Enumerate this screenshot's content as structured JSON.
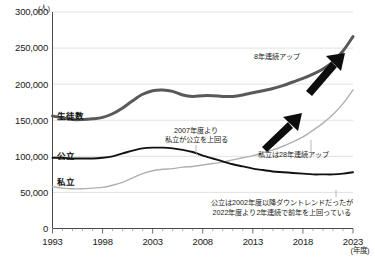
{
  "chart_data": {
    "type": "line",
    "title": "",
    "xlabel": "(年度)",
    "ylabel": "(人)",
    "ylim": [
      0,
      300000
    ],
    "xlim": [
      1993,
      2023
    ],
    "grid": true,
    "legend": "inline-labels",
    "ytick_labels": [
      "0",
      "50,000",
      "100,000",
      "150,000",
      "200,000",
      "250,000",
      "300,000"
    ],
    "ytick_values": [
      0,
      50000,
      100000,
      150000,
      200000,
      250000,
      300000
    ],
    "xtick_labels": [
      "1993",
      "1998",
      "2003",
      "2008",
      "2013",
      "2018",
      "2023"
    ],
    "xtick_values": [
      1993,
      1998,
      2003,
      2008,
      2013,
      2018,
      2023
    ],
    "x": [
      1993,
      1994,
      1995,
      1996,
      1997,
      1998,
      1999,
      2000,
      2001,
      2002,
      2003,
      2004,
      2005,
      2006,
      2007,
      2008,
      2009,
      2010,
      2011,
      2012,
      2013,
      2014,
      2015,
      2016,
      2017,
      2018,
      2019,
      2020,
      2021,
      2022,
      2023
    ],
    "series": [
      {
        "name": "生徒数",
        "color": "#595959",
        "width": 3.0,
        "values": [
          156000,
          153000,
          151000,
          151000,
          152000,
          154000,
          159000,
          167000,
          177000,
          186000,
          191000,
          192000,
          190000,
          185000,
          183000,
          184000,
          184000,
          183000,
          183000,
          185000,
          188000,
          191000,
          194000,
          198000,
          203000,
          208000,
          214000,
          221000,
          231000,
          246000,
          266000
        ]
      },
      {
        "name": "公立",
        "color": "#111111",
        "width": 1.9,
        "values": [
          98000,
          98000,
          97000,
          97000,
          97000,
          98000,
          100000,
          104000,
          108000,
          111000,
          112000,
          112000,
          111000,
          109000,
          106000,
          101000,
          97000,
          93000,
          89000,
          86000,
          83000,
          81000,
          79000,
          78000,
          77000,
          76000,
          75000,
          75000,
          75000,
          76000,
          78000
        ]
      },
      {
        "name": "私立",
        "color": "#b0b0b0",
        "width": 1.4,
        "values": [
          58000,
          56000,
          55000,
          55000,
          56000,
          57000,
          60000,
          64000,
          70000,
          76000,
          80000,
          82000,
          83000,
          85000,
          86000,
          88000,
          90000,
          92000,
          95000,
          98000,
          101000,
          105000,
          109000,
          114000,
          120000,
          127000,
          136000,
          146000,
          158000,
          173000,
          192000
        ]
      }
    ],
    "annotations": [
      {
        "id": "total-up",
        "text": "8年連続アップ"
      },
      {
        "id": "cross-over",
        "line1": "2007年度より",
        "line2": "私立が公立を上回る"
      },
      {
        "id": "private-up",
        "text": "私立は28年連続アップ"
      },
      {
        "id": "public-trend",
        "line1": "公立は2002年度以降ダウントレンドだったが",
        "line2": "2022年度より2年連続で前年を上回っている"
      }
    ]
  },
  "series_labels": {
    "total": "生徒数",
    "public": "公立",
    "private": "私立"
  },
  "axis": {
    "y_unit": "(人)",
    "x_unit": "(年度)"
  }
}
